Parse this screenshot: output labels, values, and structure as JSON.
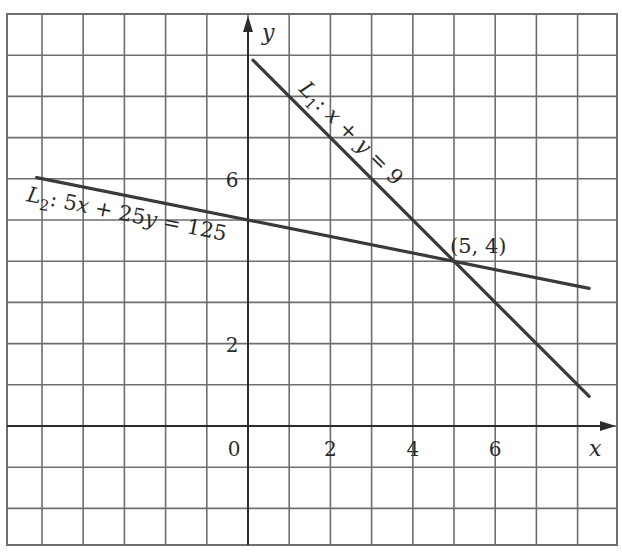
{
  "chart_data": {
    "type": "line",
    "title": "",
    "xlabel": "x",
    "ylabel": "y",
    "xlim": [
      -6,
      9
    ],
    "ylim": [
      -3,
      10
    ],
    "grid": true,
    "x_tick_labels": [
      {
        "value": 0,
        "label": "0"
      },
      {
        "value": 2,
        "label": "2"
      },
      {
        "value": 4,
        "label": "4"
      },
      {
        "value": 6,
        "label": "6"
      }
    ],
    "y_tick_labels": [
      {
        "value": 2,
        "label": "2"
      },
      {
        "value": 6,
        "label": "6"
      }
    ],
    "series": [
      {
        "name": "L1",
        "label_main": "L",
        "label_sub": "1",
        "label_rest": ": x + y = 9",
        "equation": "x + y = 9",
        "x": [
          0.12,
          8.28
        ],
        "y": [
          8.88,
          0.72
        ]
      },
      {
        "name": "L2",
        "label_main": "L",
        "label_sub": "2",
        "label_rest": ": 5x + 25y = 125",
        "equation": "5x + 25y = 125",
        "x": [
          -5.13,
          8.28
        ],
        "y": [
          6.03,
          3.34
        ]
      }
    ],
    "annotations": [
      {
        "text": "(5, 4)",
        "x": 5,
        "y": 4,
        "type": "intersection"
      }
    ]
  },
  "axes": {
    "x_label": "x",
    "y_label": "y",
    "origin_label": "0"
  },
  "colors": {
    "grid": "#6e6e6e",
    "axis": "#2b2b2b",
    "lines": "#3a3a3a",
    "text": "#2a2a2a",
    "background": "#ffffff"
  }
}
